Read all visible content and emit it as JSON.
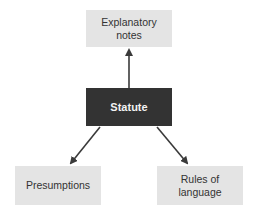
{
  "diagram": {
    "nodes": [
      {
        "id": "explanatory_notes",
        "label_line1": "Explanatory",
        "label_line2": "notes"
      },
      {
        "id": "statute",
        "label": "Statute"
      },
      {
        "id": "presumptions",
        "label": "Presumptions"
      },
      {
        "id": "rules_of_language",
        "label_line1": "Rules of",
        "label_line2": "language"
      }
    ],
    "edges": [
      {
        "from": "statute",
        "to": "explanatory_notes"
      },
      {
        "from": "statute",
        "to": "presumptions"
      },
      {
        "from": "statute",
        "to": "rules_of_language"
      }
    ],
    "colors": {
      "box": "#e4e4e4",
      "central": "#333333",
      "arrow": "#3a3a3a"
    }
  }
}
